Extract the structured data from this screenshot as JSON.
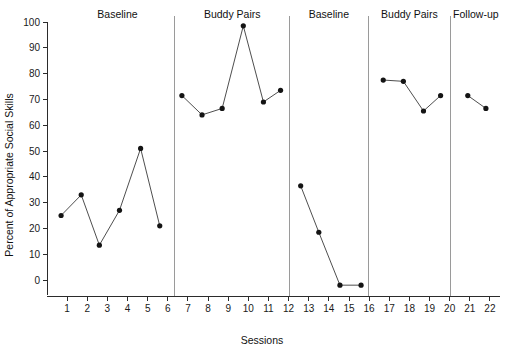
{
  "chart_data": {
    "type": "line",
    "title": "",
    "xlabel": "Sessions",
    "ylabel": "Percent of Appropriate Social Skills",
    "xlim": [
      0,
      22.5
    ],
    "ylim": [
      -6,
      100
    ],
    "grid": false,
    "legend": "none",
    "y_ticks": [
      0,
      10,
      20,
      30,
      40,
      50,
      60,
      70,
      80,
      90,
      100
    ],
    "x_ticks": [
      1,
      2,
      3,
      4,
      5,
      6,
      7,
      8,
      9,
      10,
      11,
      12,
      13,
      14,
      15,
      16,
      17,
      18,
      19,
      20,
      21,
      22
    ],
    "phase_dividers": [
      6.35,
      12.05,
      15.95,
      20.05
    ],
    "phases": [
      {
        "label": "Baseline",
        "label_x": 3.5,
        "x_start": 0.3,
        "x_end": 6.35,
        "x": [
          0.7,
          1.7,
          2.6,
          3.6,
          4.65,
          5.6
        ],
        "y": [
          25,
          33,
          13.5,
          27,
          51,
          21
        ]
      },
      {
        "label": "Buddy Pairs",
        "label_x": 9.2,
        "x_start": 6.35,
        "x_end": 12.05,
        "x": [
          6.7,
          7.7,
          8.7,
          9.75,
          10.75,
          11.6
        ],
        "y": [
          71.5,
          64,
          66.5,
          98.5,
          69,
          73.5
        ]
      },
      {
        "label": "Baseline",
        "label_x": 14.0,
        "x_start": 12.05,
        "x_end": 15.95,
        "x": [
          12.6,
          13.5,
          14.55,
          15.6
        ],
        "y": [
          36.5,
          18.5,
          -2,
          -2
        ]
      },
      {
        "label": "Buddy Pairs",
        "label_x": 18.0,
        "x_start": 15.95,
        "x_end": 20.05,
        "x": [
          16.7,
          17.7,
          18.7,
          19.55
        ],
        "y": [
          77.5,
          77,
          65.5,
          71.5
        ]
      },
      {
        "label": "Follow-up",
        "label_x": 21.3,
        "x_start": 20.05,
        "x_end": 22.4,
        "x": [
          20.9,
          21.8
        ],
        "y": [
          71.5,
          66.5
        ]
      }
    ],
    "colors": {
      "line": "#3a3a3a",
      "marker": "#141414",
      "axis": "#2b2b2b",
      "divider": "#9a9a9a",
      "background": "#ffffff"
    }
  }
}
